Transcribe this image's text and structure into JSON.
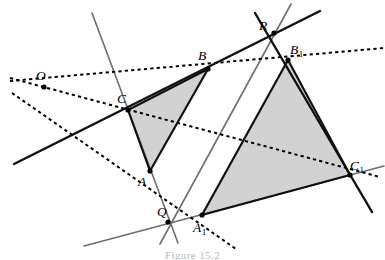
{
  "figure": {
    "caption": "Figure 15.2",
    "background_color": "#ffffff",
    "shade_color": "#d2d2d2",
    "solid_line_color": "#101010",
    "gray_line_color": "#6e6e6e",
    "dotted_line_color": "#000000",
    "point_marker_color": "#000000"
  },
  "points": {
    "O": {
      "label": "O",
      "sub": "",
      "x": 44,
      "y": 87,
      "label_x": 36,
      "label_y": 80,
      "marker": true
    },
    "Q": {
      "label": "Q",
      "sub": "",
      "x": 168,
      "y": 222,
      "label_x": 157,
      "label_y": 216,
      "marker": true
    },
    "R": {
      "label": "R",
      "sub": "",
      "x": 274,
      "y": 33,
      "label_x": 259,
      "label_y": 30,
      "marker": true
    },
    "A": {
      "label": "A",
      "sub": "",
      "x": 150,
      "y": 171,
      "label_x": 138,
      "label_y": 186,
      "marker": true
    },
    "B": {
      "label": "B",
      "sub": "",
      "x": 208,
      "y": 69,
      "label_x": 198,
      "label_y": 60,
      "marker": true
    },
    "C": {
      "label": "C",
      "sub": "",
      "x": 128,
      "y": 110,
      "label_x": 117,
      "label_y": 103,
      "marker": true
    },
    "A1": {
      "label": "A",
      "sub": "1",
      "x": 202,
      "y": 215,
      "label_x": 193,
      "label_y": 232,
      "marker": true
    },
    "B1": {
      "label": "B",
      "sub": "1",
      "x": 288,
      "y": 60,
      "label_x": 290,
      "label_y": 54,
      "marker": true
    },
    "C1": {
      "label": "C",
      "sub": "1",
      "x": 350,
      "y": 175,
      "label_x": 350,
      "label_y": 170,
      "marker": true
    }
  },
  "triangles": {
    "ABC": {
      "name": "triangle-abc",
      "vertices": "A,B,C",
      "shaded": true
    },
    "A1B1C1": {
      "name": "triangle-a1b1c1",
      "vertices": "A1,B1,C1",
      "shaded": true
    }
  },
  "lines": {
    "solid": [
      {
        "name": "line-c-b-r-axis",
        "x1": 14,
        "y1": 164,
        "x2": 320,
        "y2": 11,
        "width": 2.4
      },
      {
        "name": "line-r-b1-c1",
        "x1": 255,
        "y1": 13,
        "x2": 372,
        "y2": 212,
        "width": 2.4
      },
      {
        "name": "segment-a-b",
        "x1": 150,
        "y1": 171,
        "x2": 208,
        "y2": 69,
        "width": 2.2
      },
      {
        "name": "segment-a-c",
        "x1": 150,
        "y1": 171,
        "x2": 128,
        "y2": 110,
        "width": 2.2
      },
      {
        "name": "segment-b-c",
        "x1": 208,
        "y1": 69,
        "x2": 128,
        "y2": 110,
        "width": 2.2
      },
      {
        "name": "segment-a1-b1",
        "x1": 202,
        "y1": 215,
        "x2": 288,
        "y2": 60,
        "width": 2.2
      },
      {
        "name": "segment-a1-c1",
        "x1": 202,
        "y1": 215,
        "x2": 350,
        "y2": 175,
        "width": 2.2
      },
      {
        "name": "segment-b1-c1",
        "x1": 288,
        "y1": 60,
        "x2": 350,
        "y2": 175,
        "width": 2.2
      }
    ],
    "gray": [
      {
        "name": "line-c-a-q-extended",
        "x1": 92,
        "y1": 13,
        "x2": 178,
        "y2": 243,
        "width": 1.6
      },
      {
        "name": "line-b-a1-r-extended",
        "x1": 291,
        "y1": 4,
        "x2": 160,
        "y2": 244,
        "width": 1.6
      },
      {
        "name": "line-q-a1-c1-axis",
        "x1": 84,
        "y1": 246,
        "x2": 384,
        "y2": 166,
        "width": 1.6
      }
    ],
    "dotted": [
      {
        "name": "dotted-line-o-b-b1",
        "x1": 10,
        "y1": 81,
        "x2": 384,
        "y2": 48,
        "width": 2.0
      },
      {
        "name": "dotted-line-o-c-c1",
        "x1": 10,
        "y1": 78,
        "x2": 380,
        "y2": 177,
        "width": 2.0
      },
      {
        "name": "dotted-line-o-a-a1",
        "x1": 12,
        "y1": 93,
        "x2": 236,
        "y2": 249,
        "width": 2.0
      }
    ]
  }
}
